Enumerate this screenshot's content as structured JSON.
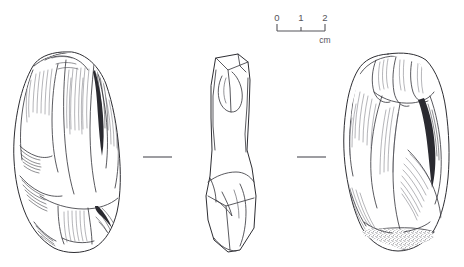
{
  "plate": {
    "title": "Lithic artefact illustration plate",
    "background_color": "#ffffff",
    "ink_color": "#2e2e33",
    "width": 464,
    "height": 267
  },
  "scale": {
    "name": "scale-bar",
    "unit": "cm",
    "ticks": [
      "0",
      "1",
      "2"
    ],
    "tick_values": [
      0,
      1,
      2
    ],
    "bar_x_start": 277,
    "bar_x_end": 325,
    "bar_y": 30,
    "label_y": 20,
    "unit_label_x": 322,
    "unit_label_y": 44,
    "color": "#55545a"
  },
  "views": [
    {
      "id": "view-left",
      "label": "ventral face",
      "position": "left",
      "texture": "dense curved hatching, flake scars",
      "center_x": 66,
      "center_y": 155
    },
    {
      "id": "view-middle",
      "label": "lateral profile",
      "position": "middle",
      "texture": "plain outline, faceted edges",
      "center_x": 228,
      "center_y": 155
    },
    {
      "id": "view-right",
      "label": "dorsal face",
      "position": "right",
      "texture": "curved hatching with stippled cortex at base",
      "center_x": 396,
      "center_y": 152
    }
  ],
  "separators": [
    {
      "id": "separator-left",
      "x1": 143,
      "x2": 172,
      "y": 157
    },
    {
      "id": "separator-right",
      "x1": 297,
      "x2": 326,
      "y": 157
    }
  ]
}
